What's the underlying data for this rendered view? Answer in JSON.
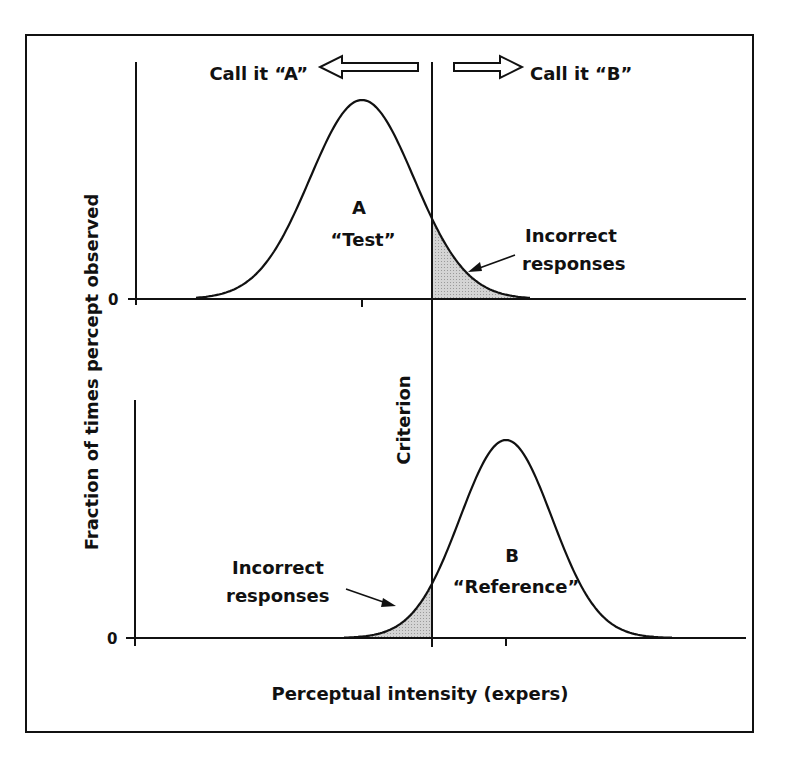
{
  "figure": {
    "arrow_left_label": "Call it “A”",
    "arrow_right_label": "Call it “B”",
    "y_axis_label": "Fraction of times percept observed",
    "x_axis_label": "Perceptual intensity (expers)",
    "criterion_label": "Criterion",
    "top_zero_label": "0",
    "bottom_zero_label": "0",
    "curve_a_letter": "A",
    "curve_a_name": "“Test”",
    "curve_b_letter": "B",
    "curve_b_name": "“Reference”",
    "top_incorrect_line1": "Incorrect",
    "top_incorrect_line2": "responses",
    "bottom_incorrect_line1": "Incorrect",
    "bottom_incorrect_line2": "responses",
    "colors": {
      "line": "#111111",
      "shade": "#c8c8c8",
      "background": "#ffffff"
    }
  },
  "chart_data": [
    {
      "type": "line",
      "title": "",
      "panel": "top",
      "series": [
        {
          "name": "A “Test”",
          "distribution": "gaussian",
          "mean_x_px": 362,
          "peak_height_rel": 1.0
        }
      ],
      "criterion_x_px": 432,
      "shaded_region": "right tail of A beyond criterion (Incorrect responses)",
      "xlabel": "Perceptual intensity (expers)",
      "ylabel": "Fraction of times percept observed",
      "y_tick_labels": [
        "0"
      ],
      "grid": false
    },
    {
      "type": "line",
      "title": "",
      "panel": "bottom",
      "series": [
        {
          "name": "B “Reference”",
          "distribution": "gaussian",
          "mean_x_px": 506,
          "peak_height_rel": 0.85
        }
      ],
      "criterion_x_px": 432,
      "shaded_region": "left tail of B below criterion (Incorrect responses)",
      "xlabel": "Perceptual intensity (expers)",
      "ylabel": "Fraction of times percept observed",
      "y_tick_labels": [
        "0"
      ],
      "grid": false
    }
  ]
}
